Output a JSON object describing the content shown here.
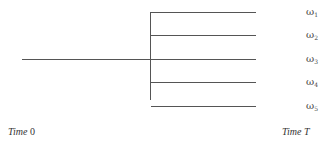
{
  "diagram": {
    "type": "scenario-tree",
    "trunk": {
      "x1": 22,
      "x2": 256,
      "y": 59
    },
    "split_x": 150,
    "branch_end_x": 256,
    "branches": [
      {
        "symbol": "ω",
        "index": "1",
        "y": 12
      },
      {
        "symbol": "ω",
        "index": "2",
        "y": 35
      },
      {
        "symbol": "ω",
        "index": "3",
        "y": 59
      },
      {
        "symbol": "ω",
        "index": "4",
        "y": 82
      },
      {
        "symbol": "ω",
        "index": "5",
        "y": 106
      }
    ],
    "time_start": {
      "word": "Time",
      "value": "0"
    },
    "time_end": {
      "word": "Time",
      "value": "T"
    },
    "line_color": "#555555"
  }
}
